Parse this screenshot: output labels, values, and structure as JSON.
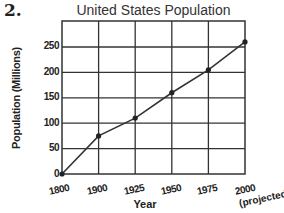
{
  "question_number": "2.",
  "chart_data": {
    "type": "line",
    "title": "United States Population",
    "xlabel": "Year",
    "ylabel": "Population (Millions)",
    "categories": [
      "1800",
      "1900",
      "1925",
      "1950",
      "1975",
      "2000"
    ],
    "x_tick_labels": [
      "1800",
      "1900",
      "1925",
      "1950",
      "1975",
      "2000"
    ],
    "x_tick_note": "(projected)",
    "y_ticks": [
      0,
      50,
      100,
      150,
      200,
      250
    ],
    "series": [
      {
        "name": "Population",
        "values": [
          0,
          75,
          110,
          160,
          205,
          260
        ]
      }
    ],
    "ylim": [
      0,
      285
    ],
    "grid": true,
    "legend": "none",
    "annotations": [
      "2000 value is projected"
    ]
  },
  "labels": {
    "title": "United States Population",
    "ylabel": "Population (Millions)",
    "xlabel": "Year",
    "projected": "(projected)",
    "y0": "0",
    "y50": "50",
    "y100": "100",
    "y150": "150",
    "y200": "200",
    "y250": "250",
    "x0": "1800",
    "x1": "1900",
    "x2": "1925",
    "x3": "1950",
    "x4": "1975",
    "x5": "2000"
  },
  "colors": {
    "ink": "#222222",
    "grid": "#333333",
    "background": "#ffffff"
  }
}
